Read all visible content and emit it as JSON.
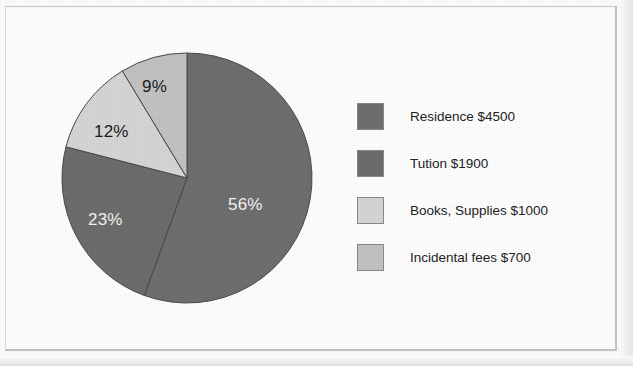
{
  "chart_data": {
    "type": "pie",
    "title": "",
    "subtitle": "",
    "xlabel": "",
    "ylabel": "",
    "legend_position": "right",
    "grid": false,
    "start_angle_deg": 0,
    "direction": "clockwise",
    "categories": [
      "Residence",
      "Tution",
      "Books, Supplies",
      "Incidental fees"
    ],
    "values": [
      4500,
      1900,
      1000,
      700
    ],
    "percent_labels": [
      "56%",
      "23%",
      "12%",
      "9%"
    ],
    "percents": [
      56,
      23,
      12,
      9
    ],
    "legend_entries": [
      "Residence $4500",
      "Tution $1900",
      "Books, Supplies $1000",
      "Incidental fees $700"
    ],
    "colors": [
      "#6f6f6f",
      "#6d6d6d",
      "#d6d6d6",
      "#c3c3c3"
    ],
    "slice_label_colors": [
      "#f4f4f4",
      "#f4f4f4",
      "#1b1b1b",
      "#1b1b1b"
    ],
    "slice_edge_color": "#4a4a4a"
  },
  "pie": {
    "slices": [
      {
        "name": "residence",
        "percent_label": "56%",
        "value": 4500,
        "color": "#6f6f6f",
        "label_x": 228,
        "label_y": 195
      },
      {
        "name": "tution",
        "percent_label": "23%",
        "value": 1900,
        "color": "#6d6d6d",
        "label_x": 88,
        "label_y": 210
      },
      {
        "name": "books-supplies",
        "percent_label": "12%",
        "value": 1000,
        "color": "#d6d6d6",
        "label_x": 94,
        "label_y": 122
      },
      {
        "name": "incidental-fees",
        "percent_label": "9%",
        "value": 700,
        "color": "#c3c3c3",
        "label_x": 142,
        "label_y": 77
      }
    ]
  },
  "legend": {
    "rows": [
      {
        "swatch_color": "#6f6f6f",
        "label": "Residence $4500"
      },
      {
        "swatch_color": "#6d6d6d",
        "label": "Tution $1900"
      },
      {
        "swatch_color": "#d6d6d6",
        "label": "Books, Supplies $1000"
      },
      {
        "swatch_color": "#c3c3c3",
        "label": "Incidental fees $700"
      }
    ]
  }
}
